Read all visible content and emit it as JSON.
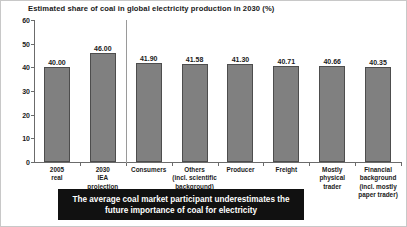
{
  "chart_data": {
    "type": "bar",
    "title": "Estimated share of coal in global electricity production in 2030 (%)",
    "xlabel": "",
    "ylabel": "",
    "ylim": [
      0,
      60
    ],
    "yticks": [
      0,
      10,
      20,
      30,
      40,
      50,
      60
    ],
    "ytick_labels": [
      "0",
      "10",
      "20",
      "30",
      "40",
      "50",
      "60"
    ],
    "grid": false,
    "legend": "none",
    "categories": [
      "2005 real",
      "2030 IEA projection",
      "Consumers",
      "Others (incl. scientific background)",
      "Producer",
      "Freight",
      "Mostly physical trader",
      "Financial background (incl. mostly paper trader)"
    ],
    "values": [
      40.0,
      46.0,
      41.9,
      41.58,
      41.3,
      40.71,
      40.66,
      40.35
    ],
    "value_labels": [
      "40.00",
      "46.00",
      "41.90",
      "41.58",
      "41.30",
      "40.71",
      "40.66",
      "40.35"
    ],
    "bar_color": "#808080",
    "bar_edge_color": "#4d4d4d",
    "axis_color": "#6b6b6b",
    "separator_after_index": 1,
    "groups": [
      {
        "name": "reference",
        "category_indices": [
          0,
          1
        ]
      },
      {
        "name": "survey-participants",
        "category_indices": [
          2,
          3,
          4,
          5,
          6,
          7
        ]
      }
    ]
  },
  "category_label_lines": [
    [
      "2005",
      "real"
    ],
    [
      "2030",
      "IEA",
      "projection"
    ],
    [
      "Consumers"
    ],
    [
      "Others",
      "(incl. scientific",
      "background)"
    ],
    [
      "Producer"
    ],
    [
      "Freight"
    ],
    [
      "Mostly",
      "physical",
      "trader"
    ],
    [
      "Financial",
      "background",
      "(incl. mostly",
      "paper trader)"
    ]
  ],
  "banner": {
    "lines": [
      "The average coal market participant underestimates the",
      "future importance of coal for electricity"
    ],
    "background_color": "#111111",
    "text_color": "#ffffff"
  }
}
